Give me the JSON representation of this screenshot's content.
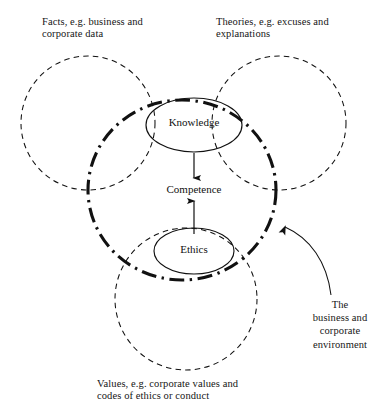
{
  "diagram": {
    "background_color": "#ffffff",
    "stroke_color": "#111111",
    "captions": {
      "facts": "Facts, e.g. business and\ncorporate data",
      "theories": "Theories, e.g. excuses and\nexplanations",
      "values": "Values, e.g. corporate values and\ncodes of ethics or conduct",
      "environment": "The\nbusiness and\ncorporate\nenvironment"
    },
    "nodes": {
      "knowledge": "Knowledge",
      "ethics": "Ethics",
      "competence": "Competence"
    },
    "shapes": {
      "circle_facts": {
        "cx": 88,
        "cy": 123,
        "r": 67,
        "style": "dashed"
      },
      "circle_theories": {
        "cx": 279,
        "cy": 123,
        "r": 67,
        "style": "dashed"
      },
      "circle_values": {
        "cx": 186,
        "cy": 299,
        "r": 71,
        "style": "dashed"
      },
      "boundary_ellipse": {
        "cx": 182,
        "cy": 190,
        "rx": 94,
        "ry": 90,
        "style": "dash-dot"
      },
      "ellipse_knowledge": {
        "cx": 194,
        "cy": 125,
        "rx": 48,
        "ry": 27,
        "style": "solid"
      },
      "ellipse_ethics": {
        "cx": 194,
        "cy": 251,
        "rx": 40,
        "ry": 23,
        "style": "solid"
      }
    },
    "arrows": {
      "knowledge_to_competence": {
        "x1": 194,
        "y1": 153,
        "x2": 194,
        "y2": 180
      },
      "ethics_to_competence": {
        "x1": 194,
        "y1": 234,
        "x2": 194,
        "y2": 199
      },
      "environment_leader": {
        "from": "The business and corporate environment",
        "to": "boundary_ellipse"
      }
    }
  }
}
